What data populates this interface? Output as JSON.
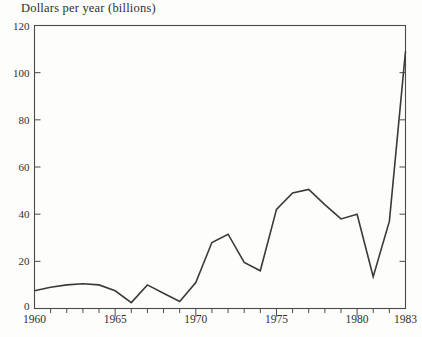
{
  "page": {
    "background": "#fdfdfb"
  },
  "chart_data": {
    "type": "line",
    "title": "Dollars per year (billions)",
    "x": [
      1960,
      1961,
      1962,
      1963,
      1964,
      1965,
      1966,
      1967,
      1968,
      1969,
      1970,
      1971,
      1972,
      1973,
      1974,
      1975,
      1976,
      1977,
      1978,
      1979,
      1980,
      1981,
      1982,
      1983
    ],
    "values": [
      7.5,
      9,
      10,
      10.5,
      10,
      7.5,
      2.5,
      10,
      6.5,
      3,
      11,
      28,
      31.5,
      19.5,
      16,
      42,
      49,
      50.5,
      44,
      38,
      40,
      13.5,
      37,
      109
    ],
    "xlabel": "",
    "ylabel": "",
    "xlim": [
      1960,
      1983
    ],
    "ylim": [
      0,
      120
    ],
    "ytick_values": [
      0,
      20,
      40,
      60,
      80,
      100,
      120
    ],
    "ytick_labels": [
      "0",
      "20",
      "40",
      "60",
      "80",
      "100",
      "120"
    ],
    "ytick_side_marks": [
      20,
      40,
      60,
      80,
      100
    ],
    "xtick_labeled_years": [
      1960,
      1965,
      1970,
      1975,
      1980,
      1983
    ],
    "xtick_major_years": [
      1965,
      1970,
      1975,
      1980
    ],
    "grid": false,
    "legend": "none",
    "frame": "box",
    "line_color": "#3a3a3a",
    "frame_color": "#4a4a4a",
    "text_color": "#2f2f2f"
  }
}
